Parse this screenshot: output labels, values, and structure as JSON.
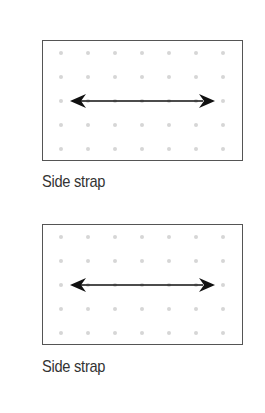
{
  "figures": [
    {
      "caption": "Side strap",
      "grid": {
        "columns": 7,
        "rows": 5,
        "dot_color": "#d6d6d6"
      },
      "arrow": {
        "direction": "horizontal-bidirectional",
        "color": "#111111"
      }
    },
    {
      "caption": "Side strap",
      "grid": {
        "columns": 7,
        "rows": 5,
        "dot_color": "#d6d6d6"
      },
      "arrow": {
        "direction": "horizontal-bidirectional",
        "color": "#111111"
      }
    }
  ]
}
